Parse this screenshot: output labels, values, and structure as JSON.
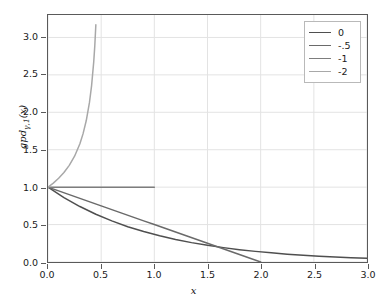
{
  "chart_data": {
    "type": "line",
    "title": "",
    "xlabel": "x",
    "ylabel_text": "gpd",
    "ylabel_sub": "γ,1",
    "ylabel_tail": "(x)",
    "ylabel_full": "gpdγ,1(x)",
    "xlim": [
      0,
      3.0
    ],
    "ylim": [
      0,
      3.3
    ],
    "grid": true,
    "legend_position": "top-right",
    "xticks": [
      "0.0",
      "0.5",
      "1.0",
      "1.5",
      "2.0",
      "2.5",
      "3.0"
    ],
    "xtick_values": [
      0,
      0.5,
      1.0,
      1.5,
      2.0,
      2.5,
      3.0
    ],
    "yticks": [
      "0.0",
      "0.5",
      "1.0",
      "1.5",
      "2.0",
      "2.5",
      "3.0"
    ],
    "ytick_values": [
      0,
      0.5,
      1.0,
      1.5,
      2.0,
      2.5,
      3.0
    ],
    "series": [
      {
        "name": "0",
        "color": "#4f4f4f",
        "x": [
          0,
          0.15,
          0.3,
          0.45,
          0.6,
          0.75,
          0.9,
          1.05,
          1.2,
          1.35,
          1.5,
          1.65,
          1.8,
          1.95,
          2.1,
          2.25,
          2.4,
          2.55,
          2.7,
          2.85,
          3.0
        ],
        "values": [
          1.0,
          0.861,
          0.741,
          0.638,
          0.549,
          0.472,
          0.407,
          0.35,
          0.301,
          0.259,
          0.223,
          0.192,
          0.165,
          0.142,
          0.122,
          0.105,
          0.091,
          0.078,
          0.067,
          0.058,
          0.05
        ]
      },
      {
        "name": "-.5",
        "color": "#6a6a6a",
        "x": [
          0,
          0.1,
          0.2,
          0.3,
          0.4,
          0.5,
          0.6,
          0.7,
          0.8,
          0.9,
          1.0,
          1.1,
          1.2,
          1.3,
          1.4,
          1.5,
          1.6,
          1.7,
          1.8,
          1.9,
          2.0
        ],
        "values": [
          1.0,
          0.95,
          0.9,
          0.85,
          0.8,
          0.75,
          0.7,
          0.65,
          0.6,
          0.55,
          0.5,
          0.45,
          0.4,
          0.35,
          0.3,
          0.25,
          0.2,
          0.15,
          0.1,
          0.05,
          0.0
        ]
      },
      {
        "name": "-1",
        "color": "#7d7d7d",
        "x": [
          0,
          0.25,
          0.5,
          0.75,
          1.0
        ],
        "values": [
          1.0,
          1.0,
          1.0,
          1.0,
          1.0
        ]
      },
      {
        "name": "-2",
        "color": "#a8a8a8",
        "x": [
          0,
          0.05,
          0.1,
          0.15,
          0.2,
          0.25,
          0.3,
          0.33,
          0.36,
          0.39,
          0.41,
          0.43,
          0.44,
          0.45
        ],
        "values": [
          1.0,
          1.054,
          1.118,
          1.195,
          1.291,
          1.414,
          1.581,
          1.715,
          1.89,
          2.132,
          2.357,
          2.673,
          2.887,
          3.17
        ]
      }
    ]
  },
  "legend": {
    "items": [
      {
        "label": "0"
      },
      {
        "label": "-.5"
      },
      {
        "label": "-1"
      },
      {
        "label": "-2"
      }
    ]
  },
  "colors": {
    "frame": "#5a5a5a",
    "grid": "#e3e3e3",
    "background": "#ffffff",
    "text": "#1a1a1a"
  }
}
